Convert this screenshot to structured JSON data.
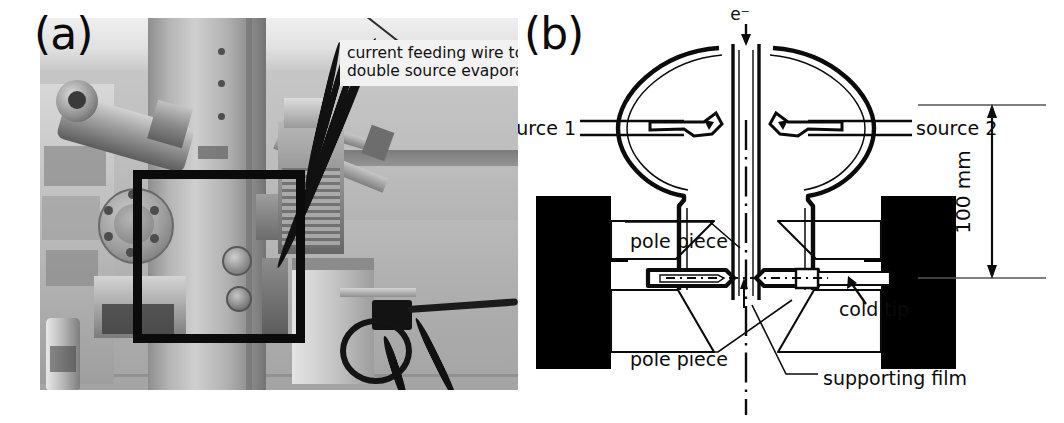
{
  "figure": {
    "panel_a_label": "(a)",
    "panel_b_label": "(b)",
    "photo_caption_line1": "current feeding wire to",
    "photo_caption_line2": "double source evaporator"
  },
  "schematic": {
    "beam_label": "e⁻",
    "source_1": "source 1",
    "source_2": "source 2",
    "pole_piece_upper": "pole piece",
    "pole_piece_lower": "pole piece",
    "cold_tip": "cold tip",
    "supporting_film": "supporting  film",
    "dimension": "100 mm"
  },
  "colors": {
    "ink": "#0b0b0b",
    "paper": "#ffffff",
    "coil_black": "#000000",
    "photo_grey": "#9a9a9a"
  }
}
